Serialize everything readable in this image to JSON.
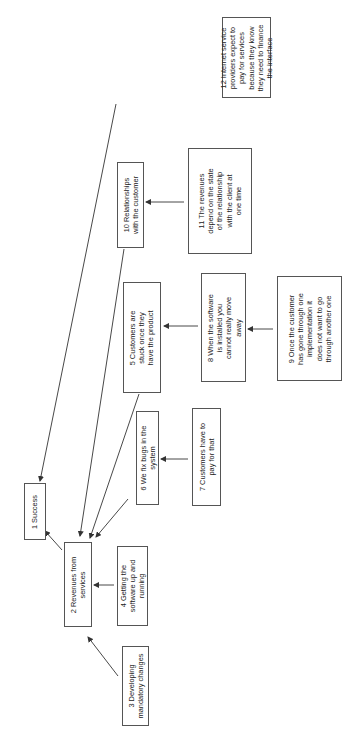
{
  "diagram": {
    "orientation": "rotated-90-ccw",
    "colors": {
      "border": "#555555",
      "text": "#222222",
      "edge": "#333333",
      "background": "#ffffff"
    },
    "nodes": [
      {
        "id": "1",
        "text": "1 Success",
        "x": 24,
        "y": 483,
        "w": 22,
        "h": 57,
        "tw": 57
      },
      {
        "id": "2",
        "text": "2 Revenues from\nservices",
        "x": 64,
        "y": 542,
        "w": 28,
        "h": 85,
        "tw": 85
      },
      {
        "id": "3",
        "text": "3 Developing\nmandatory changes",
        "x": 122,
        "y": 646,
        "w": 27,
        "h": 80,
        "tw": 80
      },
      {
        "id": "4",
        "text": "4 Getting the\nsoftware up and\nrunning",
        "x": 117,
        "y": 546,
        "w": 31,
        "h": 80,
        "tw": 80
      },
      {
        "id": "5",
        "text": "5 Customers are\nstuck once they\nhave the product",
        "x": 123,
        "y": 282,
        "w": 38,
        "h": 111,
        "tw": 111
      },
      {
        "id": "6",
        "text": "6 We fix bugs in the\nsystem",
        "x": 136,
        "y": 411,
        "w": 23,
        "h": 94,
        "tw": 94
      },
      {
        "id": "7",
        "text": "7 Customers have to\npay for that",
        "x": 192,
        "y": 408,
        "w": 29,
        "h": 98,
        "tw": 98
      },
      {
        "id": "8",
        "text": "8 When the software\nis installed you\ncannot really move\naway",
        "x": 201,
        "y": 273,
        "w": 45,
        "h": 109,
        "tw": 109
      },
      {
        "id": "9",
        "text": "9 Once the customer\nhas gone through one\nimplementation it\ndoes not want to go\nthrough another one",
        "x": 277,
        "y": 276,
        "w": 65,
        "h": 105,
        "tw": 105
      },
      {
        "id": "10",
        "text": "10 Relationships\nwith the customer",
        "x": 117,
        "y": 162,
        "w": 27,
        "h": 86,
        "tw": 86
      },
      {
        "id": "11",
        "text": "11 The revenues\ndepend on the state\nof the relationship\nwith the client at\none time",
        "x": 188,
        "y": 148,
        "w": 64,
        "h": 106,
        "tw": 106
      },
      {
        "id": "12",
        "text": "12 Internet service\nproviders expect to\npay for services\nbecause they know\nthey need to finance\nthe interface",
        "x": 222,
        "y": 17,
        "w": 49,
        "h": 81,
        "tw": 81
      }
    ],
    "edges": [
      {
        "from": "2",
        "to": "1",
        "x1": 62,
        "y1": 550,
        "x2": 45,
        "y2": 531
      },
      {
        "from": "3",
        "to": "2",
        "x1": 118,
        "y1": 676,
        "x2": 88,
        "y2": 637
      },
      {
        "from": "4",
        "to": "2",
        "x1": 114,
        "y1": 585,
        "x2": 94,
        "y2": 585
      },
      {
        "from": "6",
        "to": "2",
        "x1": 128,
        "y1": 499,
        "x2": 96,
        "y2": 537
      },
      {
        "from": "5",
        "to": "2",
        "x1": 139,
        "y1": 394,
        "x2": 90,
        "y2": 538
      },
      {
        "from": "10",
        "to": "2",
        "x1": 124,
        "y1": 249,
        "x2": 80,
        "y2": 536
      },
      {
        "from": "12",
        "to": "1",
        "x1": 116,
        "y1": 104,
        "x2": 40,
        "y2": 481
      },
      {
        "from": "7",
        "to": "6",
        "x1": 188,
        "y1": 459,
        "x2": 161,
        "y2": 459
      },
      {
        "from": "8",
        "to": "5",
        "x1": 198,
        "y1": 326,
        "x2": 164,
        "y2": 326
      },
      {
        "from": "9",
        "to": "8",
        "x1": 273,
        "y1": 329,
        "x2": 248,
        "y2": 329
      },
      {
        "from": "11",
        "to": "10",
        "x1": 184,
        "y1": 202,
        "x2": 146,
        "y2": 202
      }
    ]
  }
}
